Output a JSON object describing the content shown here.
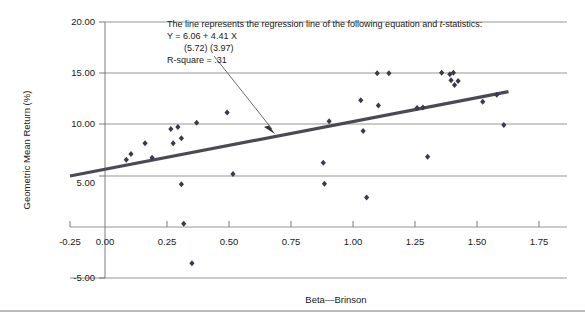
{
  "figure": {
    "background": "#ffffff",
    "bottom_rule_color": "#7a7a7a",
    "gridline_color": "#8a8a8a",
    "axis_color": "#6e6e6e",
    "marker_color": "#3a3a4a",
    "regression_line_color": "#4a4a55",
    "arrow_color": "#5a5a5a"
  },
  "chart_data": {
    "type": "scatter",
    "title": "",
    "xlabel": "Beta—Brinson",
    "ylabel": "Geometric Mean Return (%)",
    "xlim": [
      -0.25,
      1.75
    ],
    "ylim": [
      -5.0,
      20.0
    ],
    "xticks": [
      "-0.25",
      "0.00",
      "0.25",
      "0.50",
      "0.75",
      "1.00",
      "1.25",
      "1.50",
      "1.75"
    ],
    "xtick_values": [
      -0.25,
      0.0,
      0.25,
      0.5,
      0.75,
      1.0,
      1.25,
      1.5,
      1.75
    ],
    "yticks": [
      "20.00",
      "15.00",
      "10.00",
      "5.00",
      "-5.00"
    ],
    "ytick_values": [
      20.0,
      15.0,
      10.0,
      5.0,
      -5.0
    ],
    "gridlines_y": [
      20.0,
      15.0,
      10.0,
      5.0,
      0.0,
      -5.0
    ],
    "grid": true,
    "legend": null,
    "points": [
      {
        "x": -0.01,
        "y": 6.55
      },
      {
        "x": 0.01,
        "y": 7.1
      },
      {
        "x": 0.07,
        "y": 8.15
      },
      {
        "x": 0.1,
        "y": 6.75
      },
      {
        "x": 0.18,
        "y": 9.55
      },
      {
        "x": 0.19,
        "y": 8.15
      },
      {
        "x": 0.21,
        "y": 9.75
      },
      {
        "x": 0.225,
        "y": 8.65
      },
      {
        "x": 0.225,
        "y": 4.15
      },
      {
        "x": 0.235,
        "y": 0.3
      },
      {
        "x": 0.27,
        "y": -3.55
      },
      {
        "x": 0.29,
        "y": 10.15
      },
      {
        "x": 0.42,
        "y": 11.15
      },
      {
        "x": 0.445,
        "y": 5.15
      },
      {
        "x": 0.83,
        "y": 6.25
      },
      {
        "x": 0.835,
        "y": 4.2
      },
      {
        "x": 0.855,
        "y": 10.3
      },
      {
        "x": 0.99,
        "y": 12.35
      },
      {
        "x": 1.0,
        "y": 9.35
      },
      {
        "x": 1.015,
        "y": 2.85
      },
      {
        "x": 1.06,
        "y": 15.0
      },
      {
        "x": 1.065,
        "y": 11.85
      },
      {
        "x": 1.11,
        "y": 15.0
      },
      {
        "x": 1.23,
        "y": 11.6
      },
      {
        "x": 1.255,
        "y": 11.65
      },
      {
        "x": 1.275,
        "y": 6.85
      },
      {
        "x": 1.335,
        "y": 15.05
      },
      {
        "x": 1.37,
        "y": 14.9
      },
      {
        "x": 1.375,
        "y": 14.3
      },
      {
        "x": 1.385,
        "y": 15.05
      },
      {
        "x": 1.39,
        "y": 13.85
      },
      {
        "x": 1.405,
        "y": 14.25
      },
      {
        "x": 1.51,
        "y": 12.2
      },
      {
        "x": 1.57,
        "y": 12.9
      },
      {
        "x": 1.6,
        "y": 9.95
      }
    ],
    "regression": {
      "intercept": 6.06,
      "slope": 4.41,
      "x_start": -0.25,
      "x_end": 1.62,
      "r_square": 0.31,
      "t_intercept": 5.72,
      "t_slope": 3.97
    }
  },
  "annotation": {
    "line1_a": "The line represents the regression line of the following equation and ",
    "line1_italic": "t",
    "line1_b": "-statistics:",
    "line2": "Y =  6.06  + 4.41 X",
    "line3": "(5.72)   (3.97)",
    "line4": "R-square = .31"
  }
}
